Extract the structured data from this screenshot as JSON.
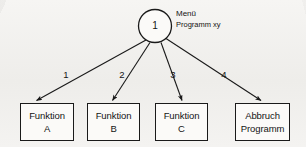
{
  "diagram": {
    "title_block": {
      "line1": "Menü",
      "line2": "Programm xy"
    },
    "root": {
      "id": "1",
      "shape": "circle"
    },
    "edges": [
      {
        "label": "1",
        "target": "funktion-a"
      },
      {
        "label": "2",
        "target": "funktion-b"
      },
      {
        "label": "3",
        "target": "funktion-c"
      },
      {
        "label": "4",
        "target": "abbruch-programm"
      }
    ],
    "boxes": [
      {
        "line1": "Funktion",
        "line2": "A"
      },
      {
        "line1": "Funktion",
        "line2": "B"
      },
      {
        "line1": "Funktion",
        "line2": "C"
      },
      {
        "line1": "Abbruch",
        "line2": "Programm"
      }
    ],
    "colors": {
      "ink": "#1a1a1a",
      "paper": "#f2f1ef",
      "box_fill": "#fbfaf8"
    }
  }
}
